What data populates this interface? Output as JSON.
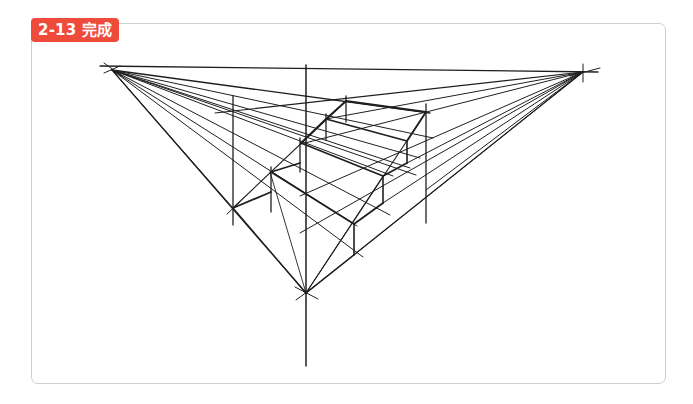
{
  "figure": {
    "label": "2-13 完成",
    "badge_color": "#ee4b3a",
    "line_color": "#1f1f1f",
    "vanishing_points": {
      "left": [
        112,
        70
      ],
      "right": [
        583,
        72
      ],
      "bottom": [
        306,
        293
      ]
    },
    "lines": [
      {
        "x1": 100,
        "y1": 66,
        "x2": 598,
        "y2": 72,
        "w": 1.3
      },
      {
        "x1": 104,
        "y1": 63,
        "x2": 122,
        "y2": 76,
        "w": 1
      },
      {
        "x1": 104,
        "y1": 73,
        "x2": 120,
        "y2": 66,
        "w": 1
      },
      {
        "x1": 570,
        "y1": 76,
        "x2": 600,
        "y2": 68,
        "w": 1
      },
      {
        "x1": 583,
        "y1": 64,
        "x2": 583,
        "y2": 82,
        "w": 1
      },
      {
        "x1": 306,
        "y1": 65,
        "x2": 306,
        "y2": 366,
        "w": 1.5
      },
      {
        "x1": 233,
        "y1": 96,
        "x2": 233,
        "y2": 225,
        "w": 1.3
      },
      {
        "x1": 426,
        "y1": 104,
        "x2": 426,
        "y2": 223,
        "w": 1.3
      },
      {
        "x1": 295,
        "y1": 287,
        "x2": 318,
        "y2": 299,
        "w": 1
      },
      {
        "x1": 296,
        "y1": 300,
        "x2": 315,
        "y2": 286,
        "w": 1
      },
      {
        "x1": 112,
        "y1": 70,
        "x2": 430,
        "y2": 113,
        "w": 1.3
      },
      {
        "x1": 112,
        "y1": 70,
        "x2": 433,
        "y2": 138,
        "w": 1
      },
      {
        "x1": 112,
        "y1": 70,
        "x2": 420,
        "y2": 158,
        "w": 1
      },
      {
        "x1": 112,
        "y1": 70,
        "x2": 416,
        "y2": 175,
        "w": 1
      },
      {
        "x1": 112,
        "y1": 70,
        "x2": 393,
        "y2": 176,
        "w": 1
      },
      {
        "x1": 112,
        "y1": 70,
        "x2": 390,
        "y2": 215,
        "w": 1
      },
      {
        "x1": 112,
        "y1": 70,
        "x2": 363,
        "y2": 257,
        "w": 1
      },
      {
        "x1": 112,
        "y1": 70,
        "x2": 306,
        "y2": 293,
        "w": 1.2
      },
      {
        "x1": 112,
        "y1": 70,
        "x2": 357,
        "y2": 226,
        "w": 1
      },
      {
        "x1": 112,
        "y1": 70,
        "x2": 410,
        "y2": 168,
        "w": 1
      },
      {
        "x1": 583,
        "y1": 72,
        "x2": 215,
        "y2": 113,
        "w": 1.1
      },
      {
        "x1": 583,
        "y1": 72,
        "x2": 326,
        "y2": 119,
        "w": 1
      },
      {
        "x1": 583,
        "y1": 72,
        "x2": 301,
        "y2": 144,
        "w": 1
      },
      {
        "x1": 583,
        "y1": 72,
        "x2": 300,
        "y2": 196,
        "w": 1
      },
      {
        "x1": 583,
        "y1": 72,
        "x2": 300,
        "y2": 233,
        "w": 1
      },
      {
        "x1": 583,
        "y1": 72,
        "x2": 306,
        "y2": 293,
        "w": 1.2
      },
      {
        "x1": 583,
        "y1": 72,
        "x2": 354,
        "y2": 255,
        "w": 1
      },
      {
        "x1": 583,
        "y1": 72,
        "x2": 383,
        "y2": 203,
        "w": 1
      },
      {
        "x1": 583,
        "y1": 72,
        "x2": 407,
        "y2": 163,
        "w": 1
      },
      {
        "x1": 112,
        "y1": 70,
        "x2": 233,
        "y2": 208,
        "w": 1
      },
      {
        "x1": 583,
        "y1": 72,
        "x2": 426,
        "y2": 190,
        "w": 1
      },
      {
        "x1": 233,
        "y1": 208,
        "x2": 306,
        "y2": 293,
        "w": 1.2
      },
      {
        "x1": 233,
        "y1": 208,
        "x2": 346,
        "y2": 101,
        "w": 1.1
      },
      {
        "x1": 227,
        "y1": 214,
        "x2": 240,
        "y2": 202,
        "w": 1
      },
      {
        "x1": 306,
        "y1": 293,
        "x2": 426,
        "y2": 112,
        "w": 1.1
      },
      {
        "x1": 306,
        "y1": 293,
        "x2": 383,
        "y2": 176,
        "w": 1
      },
      {
        "x1": 306,
        "y1": 293,
        "x2": 270,
        "y2": 172,
        "w": 0.9
      },
      {
        "x1": 346,
        "y1": 96,
        "x2": 346,
        "y2": 122,
        "w": 1.3
      },
      {
        "x1": 346,
        "y1": 101,
        "x2": 426,
        "y2": 112,
        "w": 1.8
      },
      {
        "x1": 326,
        "y1": 119,
        "x2": 346,
        "y2": 101,
        "w": 1.8
      },
      {
        "x1": 326,
        "y1": 114,
        "x2": 326,
        "y2": 140,
        "w": 1.3
      },
      {
        "x1": 326,
        "y1": 119,
        "x2": 407,
        "y2": 141,
        "w": 1.8
      },
      {
        "x1": 407,
        "y1": 141,
        "x2": 426,
        "y2": 112,
        "w": 1.8
      },
      {
        "x1": 407,
        "y1": 141,
        "x2": 407,
        "y2": 163,
        "w": 1.6
      },
      {
        "x1": 301,
        "y1": 143,
        "x2": 326,
        "y2": 119,
        "w": 1.8
      },
      {
        "x1": 301,
        "y1": 143,
        "x2": 383,
        "y2": 176,
        "w": 1.8
      },
      {
        "x1": 383,
        "y1": 176,
        "x2": 407,
        "y2": 163,
        "w": 1.8
      },
      {
        "x1": 383,
        "y1": 176,
        "x2": 383,
        "y2": 203,
        "w": 1.6
      },
      {
        "x1": 300,
        "y1": 138,
        "x2": 300,
        "y2": 172,
        "w": 1.3
      },
      {
        "x1": 300,
        "y1": 163,
        "x2": 271,
        "y2": 172,
        "w": 1.8
      },
      {
        "x1": 271,
        "y1": 172,
        "x2": 354,
        "y2": 224,
        "w": 1.8
      },
      {
        "x1": 354,
        "y1": 224,
        "x2": 383,
        "y2": 203,
        "w": 1.8
      },
      {
        "x1": 354,
        "y1": 224,
        "x2": 354,
        "y2": 255,
        "w": 1.6
      },
      {
        "x1": 271,
        "y1": 167,
        "x2": 271,
        "y2": 212,
        "w": 1.3
      },
      {
        "x1": 233,
        "y1": 208,
        "x2": 271,
        "y2": 192,
        "w": 1.8
      },
      {
        "x1": 306,
        "y1": 293,
        "x2": 354,
        "y2": 255,
        "w": 1.1
      }
    ]
  }
}
